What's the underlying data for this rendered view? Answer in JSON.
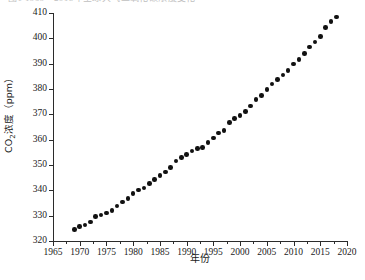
{
  "figure": {
    "top_cut_caption": "图1  1969—2018年全球大气二氧化碳浓度变化",
    "background_color": "#ffffff",
    "marker_color": "#111111",
    "axis_color": "#2b2b2b"
  },
  "axis": {
    "xlabel": "年份",
    "ylabel_prefix": "CO",
    "ylabel_sub": "2",
    "ylabel_suffix": "浓度（ppm）",
    "ylabel_full": "CO2浓度（ppm）",
    "xticks": [
      1965,
      1970,
      1975,
      1980,
      1985,
      1990,
      1995,
      2000,
      2005,
      2010,
      2015,
      2020
    ],
    "yticks": [
      320,
      330,
      340,
      350,
      360,
      370,
      380,
      390,
      400,
      410
    ]
  },
  "chart_data": {
    "type": "scatter",
    "title": "",
    "xlabel": "年份",
    "ylabel": "CO2浓度（ppm）",
    "xlim": [
      1965,
      2020
    ],
    "ylim": [
      320,
      410
    ],
    "grid": false,
    "legend": "none",
    "marker": "filled-circle",
    "series": [
      {
        "name": "全球大气CO2年均浓度",
        "x": [
          1969,
          1970,
          1971,
          1972,
          1973,
          1974,
          1975,
          1976,
          1977,
          1978,
          1979,
          1980,
          1981,
          1982,
          1983,
          1984,
          1985,
          1986,
          1987,
          1988,
          1989,
          1990,
          1991,
          1992,
          1993,
          1994,
          1995,
          1996,
          1997,
          1998,
          1999,
          2000,
          2001,
          2002,
          2003,
          2004,
          2005,
          2006,
          2007,
          2008,
          2009,
          2010,
          2011,
          2012,
          2013,
          2014,
          2015,
          2016,
          2017,
          2018
        ],
        "y": [
          324.6,
          325.7,
          326.3,
          327.5,
          329.7,
          330.2,
          331.1,
          332.0,
          333.8,
          335.4,
          336.8,
          338.8,
          340.1,
          341.0,
          342.6,
          344.3,
          345.9,
          347.2,
          348.9,
          351.5,
          352.9,
          354.2,
          355.6,
          356.4,
          357.0,
          358.8,
          360.7,
          362.6,
          363.7,
          366.7,
          368.4,
          369.6,
          371.2,
          373.3,
          375.8,
          377.5,
          379.8,
          381.9,
          383.8,
          385.6,
          387.4,
          389.9,
          391.7,
          393.9,
          396.5,
          398.6,
          400.8,
          404.2,
          406.6,
          408.5
        ],
        "marker_color": "#111111"
      }
    ]
  }
}
